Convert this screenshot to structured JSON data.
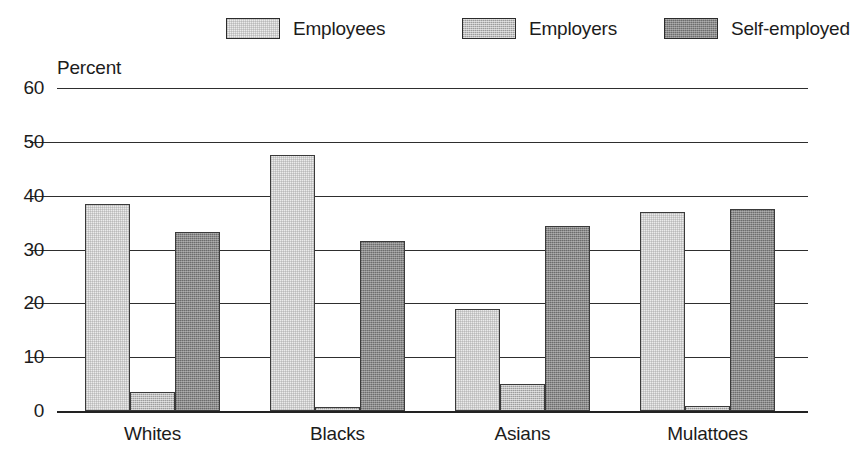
{
  "chart_data": {
    "type": "bar",
    "title": "",
    "subtitle": "",
    "xlabel": "",
    "ylabel": "Percent",
    "ylim": [
      0,
      60
    ],
    "yticks": [
      0,
      10,
      20,
      30,
      40,
      50,
      60
    ],
    "grid": true,
    "legend_position": "top-center",
    "categories": [
      "Whites",
      "Blacks",
      "Asians",
      "Mulattoes"
    ],
    "series": [
      {
        "name": "Employees",
        "color": "#ebebeb",
        "values": [
          38.5,
          47.6,
          19.0,
          37.0
        ]
      },
      {
        "name": "Employers",
        "color": "#bdbdbd",
        "values": [
          3.5,
          0.8,
          5.0,
          1.0
        ]
      },
      {
        "name": "Self-employed",
        "color": "#8a8a8a",
        "values": [
          33.2,
          31.6,
          34.4,
          37.5
        ]
      }
    ]
  },
  "legend": {
    "entries": [
      {
        "label": "Employees",
        "swatch_name": "legend-swatch-employees"
      },
      {
        "label": "Employers",
        "swatch_name": "legend-swatch-employers"
      },
      {
        "label": "Self-employed",
        "swatch_name": "legend-swatch-self-employed"
      }
    ]
  },
  "axis": {
    "y_title": "Percent",
    "y_tick_labels": [
      "60",
      "50",
      "40",
      "30",
      "20",
      "10",
      "0"
    ],
    "x_tick_labels": [
      "Whites",
      "Blacks",
      "Asians",
      "Mulattoes"
    ]
  },
  "colors": {
    "employees": "#ebebeb",
    "employers": "#bdbdbd",
    "self_employed": "#8a8a8a",
    "axis": "#2e2e2e",
    "text": "#1c1c1c",
    "background": "#ffffff"
  }
}
